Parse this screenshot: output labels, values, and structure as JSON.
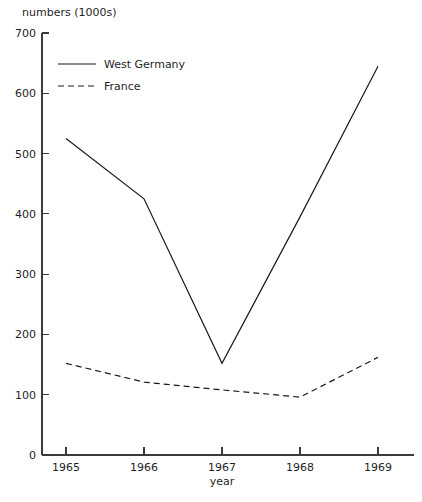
{
  "chart_data": {
    "type": "line",
    "title": "",
    "xlabel": "year",
    "ylabel": "numbers (1000s)",
    "categories": [
      "1965",
      "1966",
      "1967",
      "1968",
      "1969"
    ],
    "x": [
      1965,
      1966,
      1967,
      1968,
      1969
    ],
    "xlim": [
      1964.6,
      1969.5
    ],
    "ylim": [
      0,
      700
    ],
    "grid": false,
    "legend_position": "top-left-inside",
    "y_ticks": [
      0,
      100,
      200,
      300,
      400,
      500,
      600,
      700
    ],
    "y_tick_labels": [
      "0",
      "100",
      "200",
      "300",
      "400",
      "500",
      "600",
      "700"
    ],
    "x_tick_labels": [
      "1965",
      "1966",
      "1967",
      "1968",
      "1969"
    ],
    "series": [
      {
        "name": "West Germany",
        "style": "solid",
        "color": "#1a1a1a",
        "values": [
          525,
          425,
          152,
          395,
          645
        ]
      },
      {
        "name": "France",
        "style": "dashed",
        "color": "#1a1a1a",
        "values": [
          152,
          121,
          108,
          96,
          162
        ]
      }
    ],
    "legend": [
      {
        "label": "West Germany",
        "style": "solid"
      },
      {
        "label": "France",
        "style": "dashed"
      }
    ]
  }
}
